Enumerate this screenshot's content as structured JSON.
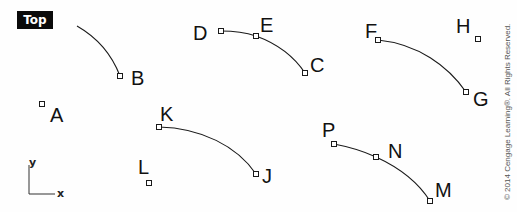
{
  "view": {
    "label": "Top"
  },
  "axes": {
    "x_label": "x",
    "y_label": "y"
  },
  "points": [
    {
      "id": "A",
      "label": "A",
      "x": 42,
      "y": 104,
      "lx": 50,
      "ly": 122
    },
    {
      "id": "B",
      "label": "B",
      "x": 120,
      "y": 76,
      "lx": 131,
      "ly": 85
    },
    {
      "id": "C",
      "label": "C",
      "x": 305,
      "y": 73,
      "lx": 310,
      "ly": 72
    },
    {
      "id": "D",
      "label": "D",
      "x": 221,
      "y": 31,
      "lx": 193,
      "ly": 40
    },
    {
      "id": "E",
      "label": "E",
      "x": 256,
      "y": 36,
      "lx": 260,
      "ly": 32
    },
    {
      "id": "F",
      "label": "F",
      "x": 378,
      "y": 40,
      "lx": 365,
      "ly": 38
    },
    {
      "id": "G",
      "label": "G",
      "x": 466,
      "y": 92,
      "lx": 473,
      "ly": 106
    },
    {
      "id": "H",
      "label": "H",
      "x": 478,
      "y": 39,
      "lx": 456,
      "ly": 33
    },
    {
      "id": "J",
      "label": "J",
      "x": 256,
      "y": 174,
      "lx": 262,
      "ly": 183
    },
    {
      "id": "K",
      "label": "K",
      "x": 159,
      "y": 127,
      "lx": 160,
      "ly": 121
    },
    {
      "id": "L",
      "label": "L",
      "x": 149,
      "y": 183,
      "lx": 138,
      "ly": 174
    },
    {
      "id": "M",
      "label": "M",
      "x": 430,
      "y": 201,
      "lx": 435,
      "ly": 197
    },
    {
      "id": "N",
      "label": "N",
      "x": 376,
      "y": 157,
      "lx": 388,
      "ly": 158
    },
    {
      "id": "P",
      "label": "P",
      "x": 334,
      "y": 144,
      "lx": 322,
      "ly": 137
    }
  ],
  "curves": [
    {
      "id": "curve-to-B",
      "d": "M77,26 C98,38 112,55 120,76"
    },
    {
      "id": "curve-D-E-C",
      "d": "M221,31 C235,31 247,33 256,36 C278,44 295,58 305,73"
    },
    {
      "id": "curve-F-G",
      "d": "M378,40 C418,44 448,66 466,92"
    },
    {
      "id": "curve-K-J",
      "d": "M159,127 C201,128 237,146 256,174"
    },
    {
      "id": "curve-P-N-M",
      "d": "M334,144 C350,147 363,151 376,157 C400,168 418,182 430,201"
    }
  ],
  "copyright": "© 2014 Cengage Learning®. All Rights Reserved."
}
